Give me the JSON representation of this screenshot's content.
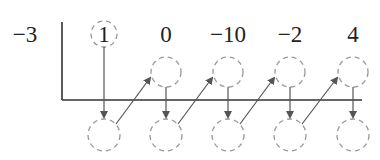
{
  "diagram": {
    "type": "synthetic-division",
    "divisor": "−3",
    "coefficients": [
      "1",
      "0",
      "−10",
      "−2",
      "4"
    ],
    "colors": {
      "text": "#222222",
      "line": "#333333",
      "arrow": "#555555",
      "circle": "#999999"
    }
  }
}
